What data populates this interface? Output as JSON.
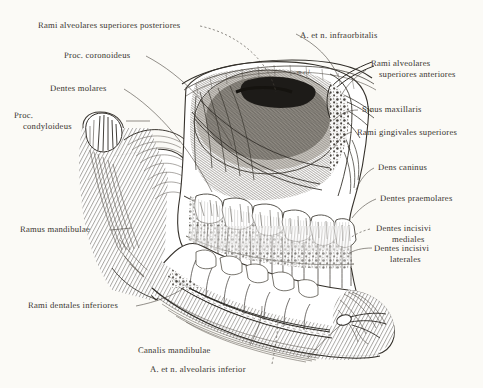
{
  "plate": {
    "title": "Anatomical engraving of the maxilla and mandible with alveolar nerves and vessels",
    "medium": "ink engraving / hatched line drawing",
    "paper_color": "#fbfaf6",
    "ink_color": "#35312c",
    "width": 483,
    "height": 388
  },
  "labels": {
    "rami_alveolares_superiores_posteriores": "Rami alveolares superiores posteriores",
    "proc_coronoideus": "Proc. coronoideus",
    "dentes_molares": "Dentes molares",
    "proc_condyloideus_l1": "Proc.",
    "proc_condyloideus_l2": "condyloideus",
    "ramus_mandibulae": "Ramus mandibulae",
    "rami_dentales_inferiores": "Rami dentales inferiores",
    "canalis_mandibulae": "Canalis mandibulae",
    "a_et_n_alveolaris_inferior": "A. et n. alveolaris inferior",
    "a_et_n_infraorbitalis": "A. et n. infraorbitalis",
    "rami_alveolares_superiores_anteriores_l1": "Rami alveolares",
    "rami_alveolares_superiores_anteriores_l2": "superiores anteriores",
    "sinus_maxillaris": "Sinus maxillaris",
    "rami_gingivales_superiores": "Rami gingivales superiores",
    "dens_caninus": "Dens caninus",
    "dentes_praemolares": "Dentes praemolares",
    "dentes_incisivi_mediales_l1": "Dentes incisivi",
    "dentes_incisivi_mediales_l2": "mediales",
    "dentes_incisivi_laterales_l1": "Dentes incisivi",
    "dentes_incisivi_laterales_l2": "laterales",
    "inline_mcl": "m.c.l."
  }
}
